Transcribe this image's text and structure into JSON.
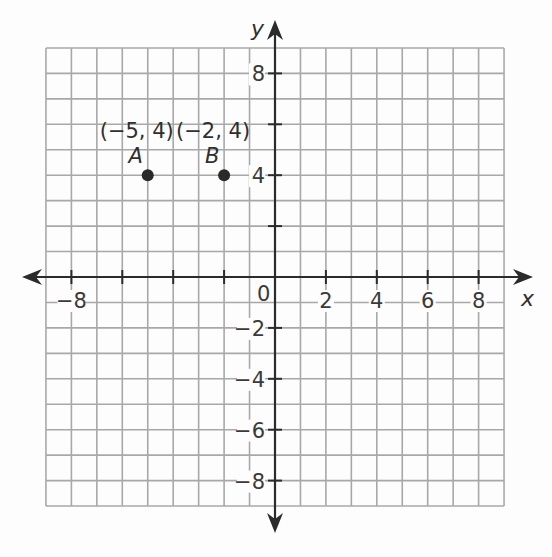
{
  "chart_data": {
    "type": "scatter",
    "title": "",
    "xlabel": "x",
    "ylabel": "y",
    "xlim": [
      -9,
      9
    ],
    "ylim": [
      -9,
      9
    ],
    "grid": true,
    "grid_step": 1,
    "x_ticks": [
      -8,
      -6,
      -4,
      -2,
      2,
      4,
      6,
      8
    ],
    "x_tick_labels": [
      {
        "value": -8,
        "label": "−8"
      },
      {
        "value": 2,
        "label": "2"
      },
      {
        "value": 4,
        "label": "4"
      },
      {
        "value": 6,
        "label": "6"
      },
      {
        "value": 8,
        "label": "8"
      }
    ],
    "y_ticks": [
      -8,
      -6,
      -4,
      -2,
      2,
      4,
      6,
      8
    ],
    "y_tick_labels": [
      {
        "value": 8,
        "label": "8"
      },
      {
        "value": 4,
        "label": "4"
      },
      {
        "value": -2,
        "label": "−2"
      },
      {
        "value": -4,
        "label": "−4"
      },
      {
        "value": -6,
        "label": "−6"
      },
      {
        "value": -8,
        "label": "−8"
      }
    ],
    "origin_label": "0",
    "points": [
      {
        "name": "A",
        "x": -5,
        "y": 4,
        "coord_label": "(−5, 4)"
      },
      {
        "name": "B",
        "x": -2,
        "y": 4,
        "coord_label": "(−2, 4)"
      }
    ]
  },
  "layout_px": {
    "origin_x": 275,
    "origin_y": 277,
    "unit": 25.45
  },
  "colors": {
    "grid": "#a8a8a8",
    "axis": "#2b2b2b",
    "point": "#2a2a2a",
    "text": "#2f2f2f",
    "background": "#fdfdfd"
  }
}
